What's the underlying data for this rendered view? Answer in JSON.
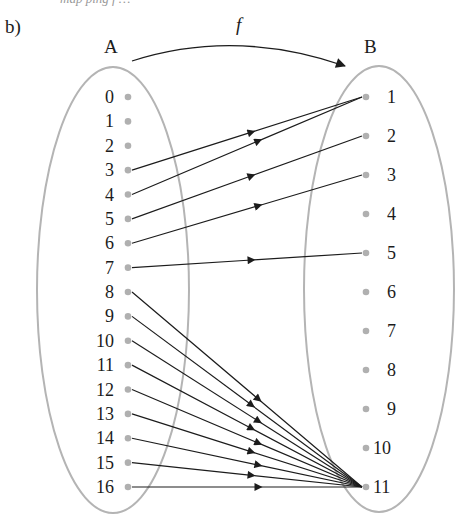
{
  "header": {
    "cut_text": "map ping f …",
    "part_label": "b)"
  },
  "diagram": {
    "function_label": "f",
    "set_A": {
      "label": "A",
      "elements": [
        "0",
        "1",
        "2",
        "3",
        "4",
        "5",
        "6",
        "7",
        "8",
        "9",
        "10",
        "11",
        "12",
        "13",
        "14",
        "15",
        "16"
      ]
    },
    "set_B": {
      "label": "B",
      "elements": [
        "1",
        "2",
        "3",
        "4",
        "5",
        "6",
        "7",
        "8",
        "9",
        "10",
        "11"
      ]
    },
    "mappings": [
      {
        "from": "3",
        "to": "1"
      },
      {
        "from": "4",
        "to": "1"
      },
      {
        "from": "5",
        "to": "2"
      },
      {
        "from": "6",
        "to": "3"
      },
      {
        "from": "7",
        "to": "5"
      },
      {
        "from": "8",
        "to": "11"
      },
      {
        "from": "9",
        "to": "11"
      },
      {
        "from": "10",
        "to": "11"
      },
      {
        "from": "11",
        "to": "11"
      },
      {
        "from": "12",
        "to": "11"
      },
      {
        "from": "13",
        "to": "11"
      },
      {
        "from": "14",
        "to": "11"
      },
      {
        "from": "15",
        "to": "11"
      },
      {
        "from": "16",
        "to": "11"
      }
    ],
    "colors": {
      "ellipse": "#b4b4b4",
      "dot": "#b0b0b0",
      "arrow": "#1c1c1c"
    }
  }
}
